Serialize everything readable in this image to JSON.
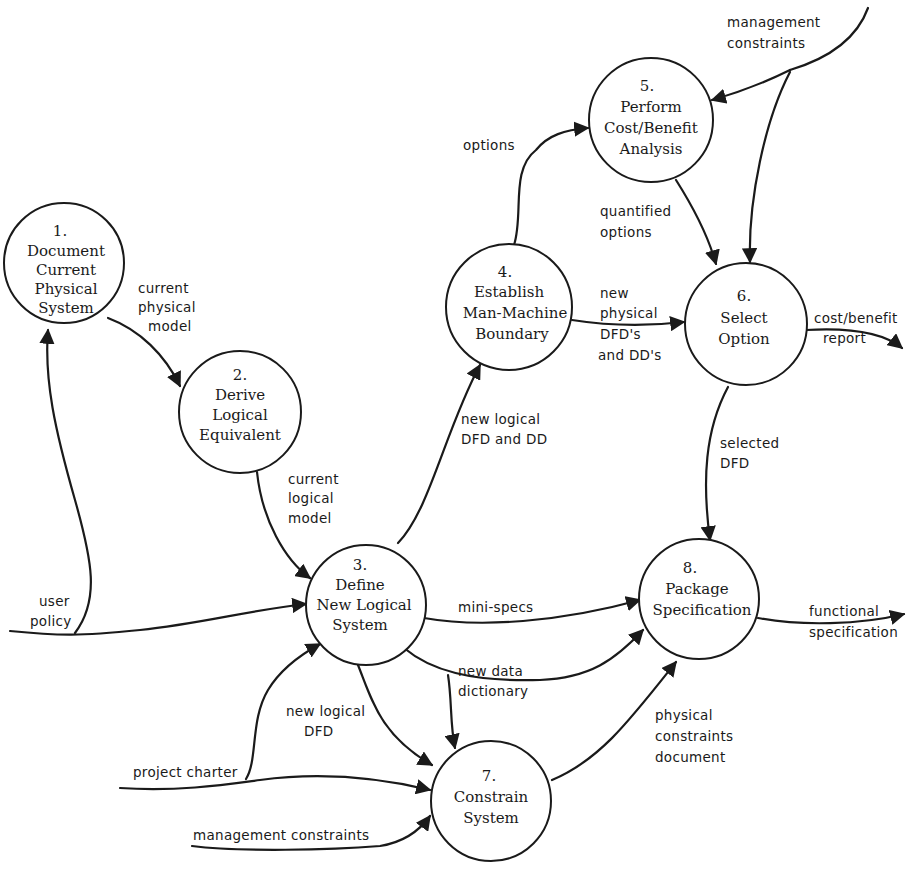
{
  "colors": {
    "ink": "#1a1a1a",
    "background": "#ffffff"
  },
  "processes": [
    {
      "id": "1",
      "number": "1.",
      "lines": [
        "Document",
        "Current",
        "Physical",
        "System"
      ]
    },
    {
      "id": "2",
      "number": "2.",
      "lines": [
        "Derive",
        "Logical",
        "Equivalent"
      ]
    },
    {
      "id": "3",
      "number": "3.",
      "lines": [
        "Define",
        "New Logical",
        "System"
      ]
    },
    {
      "id": "4",
      "number": "4.",
      "lines": [
        "Establish",
        "Man-Machine",
        "Boundary"
      ]
    },
    {
      "id": "5",
      "number": "5.",
      "lines": [
        "Perform",
        "Cost/Benefit",
        "Analysis"
      ]
    },
    {
      "id": "6",
      "number": "6.",
      "lines": [
        "Select",
        "Option"
      ]
    },
    {
      "id": "7",
      "number": "7.",
      "lines": [
        "Constrain",
        "System"
      ]
    },
    {
      "id": "8",
      "number": "8.",
      "lines": [
        "Package",
        "Specification"
      ]
    }
  ],
  "flows": {
    "current_physical_model": [
      "current",
      "physical",
      "model"
    ],
    "current_logical_model": [
      "current",
      "logical",
      "model"
    ],
    "user_policy": [
      "user",
      "policy"
    ],
    "new_logical_dfd_and_dd": [
      "new logical",
      "DFD and DD"
    ],
    "options": [
      "options"
    ],
    "management_constraints_top": [
      "management",
      "constraints"
    ],
    "quantified_options": [
      "quantified",
      "options"
    ],
    "new_physical_dfds": [
      "new",
      "physical",
      "DFD's",
      "and DD's"
    ],
    "cost_benefit_report": [
      "cost/benefit",
      "report"
    ],
    "selected_dfd": [
      "selected",
      "DFD"
    ],
    "mini_specs": [
      "mini-specs"
    ],
    "new_data_dictionary": [
      "new data",
      "dictionary"
    ],
    "new_logical_dfd": [
      "new logical",
      "DFD"
    ],
    "project_charter": [
      "project charter"
    ],
    "management_constraints_bottom": [
      "management constraints"
    ],
    "physical_constraints_document": [
      "physical",
      "constraints",
      "document"
    ],
    "functional_specification": [
      "functional",
      "specification"
    ]
  }
}
